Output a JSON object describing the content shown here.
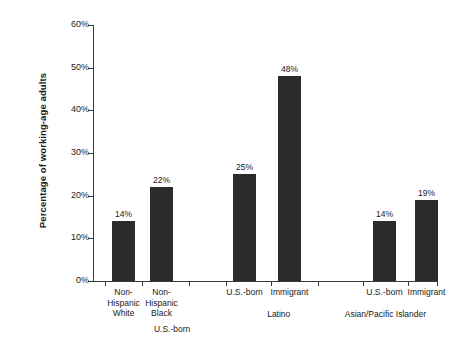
{
  "chart_data": {
    "type": "bar",
    "title": "",
    "xlabel": "",
    "ylabel": "Percentage of working-age adults",
    "ylim": [
      0,
      60
    ],
    "ytick_labels": [
      "60%",
      "50%",
      "40%",
      "30%",
      "20%",
      "10%",
      "0%"
    ],
    "ytick_values": [
      60,
      50,
      40,
      30,
      20,
      10,
      0
    ],
    "grid": false,
    "legend": "none",
    "categories": [
      "Non-\nHispanic\nWhite",
      "Non-\nHispanic\nBlack",
      "U.S.-born",
      "Immigrant",
      "U.S.-born",
      "Immigrant"
    ],
    "values": [
      14,
      22,
      25,
      48,
      14,
      19
    ],
    "value_labels": [
      "14%",
      "22%",
      "25%",
      "48%",
      "14%",
      "19%"
    ],
    "groups": [
      {
        "label": "U.S.-born",
        "left_pct": 3.0,
        "width_pct": 40.0
      },
      {
        "label": "Latino",
        "left_pct": 39.0,
        "width_pct": 30.0
      },
      {
        "label": "Asian/Pacific Islander",
        "left_pct": 68.0,
        "width_pct": 34.0
      }
    ],
    "bars": [
      {
        "label": "Non-\nHispanic\nWhite",
        "value": 14,
        "value_label": "14%",
        "left_px": 19,
        "width_px": 23
      },
      {
        "label": "Non-\nHispanic\nBlack",
        "value": 22,
        "value_label": "22%",
        "left_px": 57,
        "width_px": 23
      },
      {
        "label": "U.S.-born",
        "value": 25,
        "value_label": "25%",
        "left_px": 140,
        "width_px": 23
      },
      {
        "label": "Immigrant",
        "value": 48,
        "value_label": "48%",
        "left_px": 185,
        "width_px": 23
      },
      {
        "label": "U.S.-born",
        "value": 14,
        "value_label": "14%",
        "left_px": 280,
        "width_px": 23
      },
      {
        "label": "Immigrant",
        "value": 19,
        "value_label": "19%",
        "left_px": 322,
        "width_px": 23
      }
    ],
    "x_tick_positions_px": [
      12,
      49,
      96,
      133,
      178,
      225,
      270,
      315,
      344
    ],
    "bar_color": "#2b2b2b",
    "axis_color": "#3a3a3a",
    "text_color": "#1a1a1a",
    "background": "#ffffff"
  }
}
